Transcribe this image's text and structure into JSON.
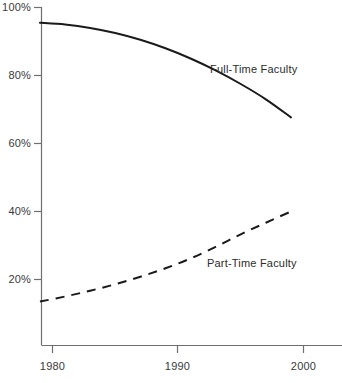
{
  "chart_data": {
    "type": "line",
    "title": "",
    "subtitle": "",
    "xlabel": "",
    "ylabel": "",
    "xlim": [
      1979,
      2000
    ],
    "ylim": [
      0,
      100
    ],
    "grid": false,
    "legend_position": "inline-annotation",
    "x_tick_labels": [
      "1980",
      "1990",
      "2000"
    ],
    "x_ticks": [
      1980,
      1990,
      2000
    ],
    "y_tick_labels": [
      "20%",
      "40%",
      "60%",
      "80%",
      "100%"
    ],
    "y_ticks": [
      20,
      40,
      60,
      80,
      100
    ],
    "series": [
      {
        "name": "Full-Time Faculty",
        "style": "solid",
        "color": "#1a1a1a",
        "x": [
          1979,
          1981,
          1983,
          1985,
          1987,
          1989,
          1991,
          1993,
          1995,
          1997,
          1999
        ],
        "values": [
          95.5,
          95.0,
          94.0,
          92.5,
          90.5,
          88.0,
          85.0,
          81.5,
          77.5,
          73.0,
          67.7
        ]
      },
      {
        "name": "Part-Time Faculty",
        "style": "dashed",
        "color": "#1a1a1a",
        "x": [
          1979,
          1981,
          1983,
          1985,
          1987,
          1989,
          1991,
          1993,
          1995,
          1997,
          1999
        ],
        "values": [
          13.5,
          15.0,
          16.7,
          18.6,
          20.8,
          23.3,
          26.2,
          29.6,
          33.3,
          36.7,
          40.0
        ]
      }
    ],
    "annotations": [
      {
        "text": "Full-Time Faculty",
        "x": 1991.5,
        "y": 80.5
      },
      {
        "text": "Part-Time Faculty",
        "x": 1991.0,
        "y": 24.5
      }
    ]
  },
  "axes": {
    "axis_color": "#6e6e6e",
    "tick_color": "#6e6e6e"
  }
}
